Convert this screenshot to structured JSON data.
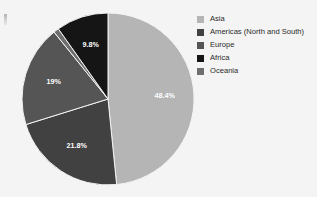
{
  "chart_data": {
    "type": "pie",
    "title": "",
    "subtitle": "",
    "xlabel": "",
    "ylabel": "",
    "grid": false,
    "legend_position": "right",
    "start_angle_deg": 0,
    "direction": "clockwise",
    "categories": [
      "Asia",
      "Americas (North and South)",
      "Europe",
      "Africa",
      "Oceania"
    ],
    "values": [
      48.4,
      21.8,
      19.0,
      9.8,
      1.0
    ],
    "slices": [
      {
        "label": "Asia",
        "value": 48.4,
        "data_label": "48.4%",
        "color": "#b5b5b5",
        "label_color": "#ffffff",
        "visible_label": true
      },
      {
        "label": "Americas (North and South)",
        "value": 21.8,
        "data_label": "21.8%",
        "color": "#414141",
        "label_color": "#ffffff",
        "visible_label": true
      },
      {
        "label": "Europe",
        "value": 19.0,
        "data_label": "19%",
        "color": "#555555",
        "label_color": "#ffffff",
        "visible_label": true
      },
      {
        "label": "Oceania",
        "value": 1.0,
        "data_label": "",
        "color": "#6e6e6e",
        "label_color": "#ffffff",
        "visible_label": false
      },
      {
        "label": "Africa",
        "value": 9.8,
        "data_label": "9.8%",
        "color": "#151515",
        "label_color": "#ffffff",
        "visible_label": true
      }
    ]
  },
  "legend": {
    "items": [
      {
        "label": "Asia",
        "color": "#b5b5b5"
      },
      {
        "label": "Americas (North and South)",
        "color": "#414141"
      },
      {
        "label": "Europe",
        "color": "#555555"
      },
      {
        "label": "Africa",
        "color": "#151515"
      },
      {
        "label": "Oceania",
        "color": "#6e6e6e"
      }
    ]
  },
  "labels": {
    "asia_pct": "48.4%",
    "americas_pct": "21.8%",
    "europe_pct": "19%",
    "africa_pct": "9.8%"
  },
  "colors": {
    "background": "#f4f4f4",
    "slice_outline": "#f4f4f4",
    "legend_text": "#2a2a2a"
  }
}
